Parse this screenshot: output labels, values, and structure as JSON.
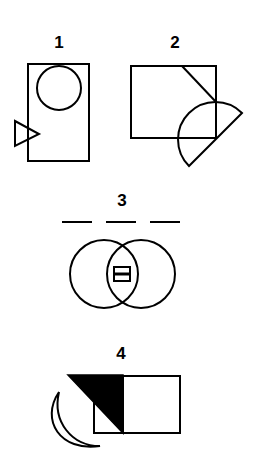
{
  "figures": [
    {
      "label": "1",
      "shapes": [
        "rectangle",
        "circle",
        "triangle"
      ]
    },
    {
      "label": "2",
      "shapes": [
        "rectangle",
        "diagonal-line",
        "semicircle"
      ]
    },
    {
      "label": "3",
      "shapes": [
        "three-dashes",
        "overlapping-circles",
        "small-box-with-bar"
      ]
    },
    {
      "label": "4",
      "shapes": [
        "divided-rectangle",
        "black-triangle",
        "crescent"
      ]
    }
  ],
  "colors": {
    "stroke": "#000000",
    "background": "#ffffff",
    "fill": "#000000"
  }
}
